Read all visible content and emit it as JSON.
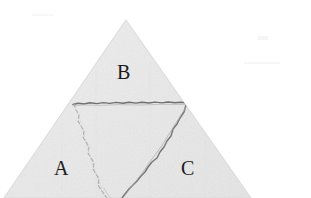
{
  "figure": {
    "name": "fractured-triangle",
    "background_color": "#ffffff",
    "fill_color": "#eaeaea",
    "fill_color_light": "#efefef",
    "edge_color": "#d8d8d8",
    "crack_color": "#7d7d7d",
    "dashed_crack_color": "#b0b0b0",
    "label_color": "#1b1b1b",
    "geometry": {
      "apex": [
        126,
        20
      ],
      "bottom_left": [
        4,
        198
      ],
      "bottom_right": [
        251,
        198
      ],
      "horizontal_crack": {
        "from": [
          73,
          104
        ],
        "to": [
          186,
          103
        ]
      },
      "solid_diagonal_crack": {
        "from": [
          186,
          107
        ],
        "to": [
          122,
          198
        ]
      },
      "dashed_crack": {
        "from": [
          74,
          104
        ],
        "to": [
          107,
          198
        ]
      }
    },
    "regions": [
      {
        "id": "A",
        "label": "A",
        "label_position": [
          54,
          158
        ]
      },
      {
        "id": "B",
        "label": "B",
        "label_position": [
          117,
          62
        ]
      },
      {
        "id": "C",
        "label": "C",
        "label_position": [
          181,
          158
        ]
      }
    ]
  }
}
